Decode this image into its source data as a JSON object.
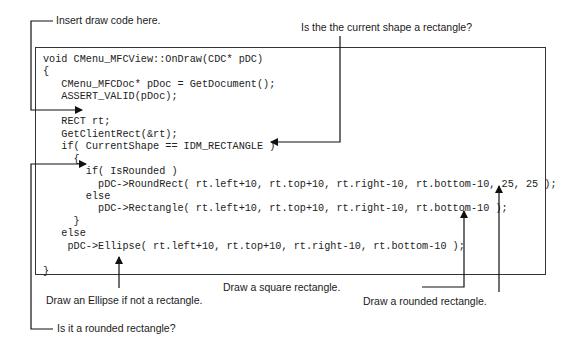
{
  "code": {
    "lines": [
      "void CMenu_MFCView::OnDraw(CDC* pDC)",
      "{",
      "   CMenu_MFCDoc* pDoc = GetDocument();",
      "   ASSERT_VALID(pDoc);",
      "",
      "   RECT rt;",
      "   GetClientRect(&rt);",
      "   if( CurrentShape == IDM_RECTANGLE )",
      "     {",
      "       if( IsRounded )",
      "         pDC->RoundRect( rt.left+10, rt.top+10, rt.right-10, rt.bottom-10, 25, 25 );",
      "       else",
      "         pDC->Rectangle( rt.left+10, rt.top+10, rt.right-10, rt.bottom-10 );",
      "     }",
      "   else",
      "    pDC->Ellipse( rt.left+10, rt.top+10, rt.right-10, rt.bottom-10 );",
      "",
      "}"
    ]
  },
  "annotations": {
    "insert_draw_code": "Insert draw code here.",
    "is_current_shape_rectangle": "Is the the current shape a rectangle?",
    "draw_ellipse": "Draw an Ellipse if not a rectangle.",
    "draw_square_rectangle": "Draw a square rectangle.",
    "draw_rounded_rectangle": "Draw a rounded rectangle.",
    "is_rounded_rectangle": "Is it a rounded rectangle?"
  },
  "colors": {
    "line": "#111111",
    "text": "#1a1a1a",
    "background": "#ffffff"
  }
}
